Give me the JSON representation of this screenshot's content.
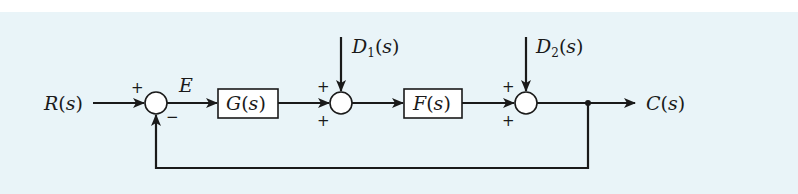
{
  "diagram": {
    "type": "block-diagram",
    "title": "",
    "signals": {
      "input": "R",
      "error": "E",
      "disturbance_1": "D",
      "disturbance_1_sub": "1",
      "disturbance_2": "D",
      "disturbance_2_sub": "2",
      "output": "C",
      "arg": "s"
    },
    "blocks": [
      {
        "id": "G",
        "name": "G",
        "arg": "s"
      },
      {
        "id": "F",
        "name": "F",
        "arg": "s"
      }
    ],
    "summing_junctions": [
      {
        "id": "sum1",
        "signs": {
          "left": "+",
          "bottom": "−"
        }
      },
      {
        "id": "sum2",
        "signs": {
          "top": "+",
          "left": "+"
        }
      },
      {
        "id": "sum3",
        "signs": {
          "top": "+",
          "left": "+"
        }
      }
    ],
    "connections": [
      "R(s) -> sum1 (+)",
      "sum1 -> E -> G(s)",
      "G(s) -> sum2 (+)",
      "D1(s) -> sum2 (+)",
      "sum2 -> F(s)",
      "F(s) -> sum3 (+)",
      "D2(s) -> sum3 (+)",
      "sum3 -> C(s)",
      "C(s) -> feedback -> sum1 (−)"
    ],
    "colors": {
      "background": "#e9f4f8",
      "stroke": "#1a1a1a",
      "block_fill": "#ffffff"
    }
  }
}
